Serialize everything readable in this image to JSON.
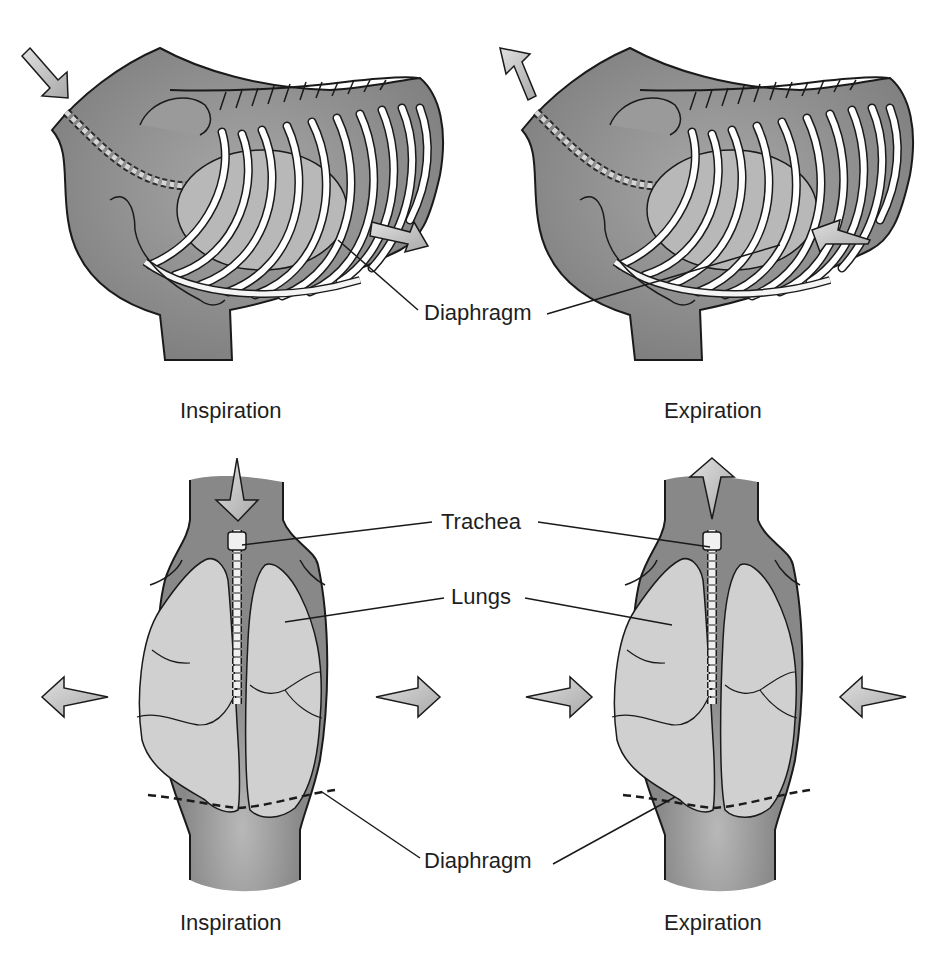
{
  "figure": {
    "panels": [
      {
        "id": "lateral-inspiration",
        "view": "lateral",
        "caption": "Inspiration",
        "arrows": [
          "inward-cranial",
          "caudal-diaphragm"
        ]
      },
      {
        "id": "lateral-expiration",
        "view": "lateral",
        "caption": "Expiration",
        "arrows": [
          "outward-cranial",
          "cranial-diaphragm"
        ]
      },
      {
        "id": "dorsal-inspiration",
        "view": "dorsal",
        "caption": "Inspiration",
        "arrows": [
          "down-into-trachea",
          "outward-left",
          "outward-right"
        ]
      },
      {
        "id": "dorsal-expiration",
        "view": "dorsal",
        "caption": "Expiration",
        "arrows": [
          "up-out-trachea",
          "inward-left",
          "inward-right"
        ]
      }
    ],
    "labels": {
      "top_diaphragm": "Diaphragm",
      "trachea": "Trachea",
      "lungs": "Lungs",
      "bottom_diaphragm": "Diaphragm"
    },
    "captions": {
      "top_left": "Inspiration",
      "top_right": "Expiration",
      "bottom_left": "Inspiration",
      "bottom_right": "Expiration"
    },
    "colors": {
      "body": "#8a8a8a",
      "body_light": "#b4b4b4",
      "lung": "#cfcfcf",
      "rib": "#ffffff",
      "arrow": "#c8c8c8",
      "outline": "#1a1a1a",
      "text": "#1e1e1e"
    }
  }
}
